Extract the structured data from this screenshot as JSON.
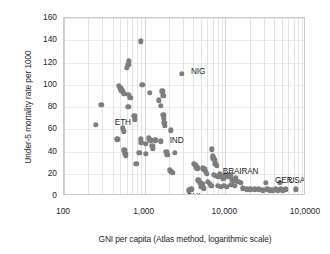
{
  "chart_data": {
    "type": "scatter",
    "title": "",
    "xlabel": "GNI per capita (Atlas method, logarithmic scale)",
    "ylabel": "Under-5 mortality rate per 1000",
    "xscale": "log",
    "xlim": [
      100,
      100000
    ],
    "ylim": [
      0,
      160
    ],
    "ytick_step": 20,
    "grid": true,
    "legend": "none",
    "marker_color": "#7d7d7d",
    "xticks": [
      {
        "value": 100,
        "label": "100"
      },
      {
        "value": 1000,
        "label": "1,000"
      },
      {
        "value": 10000,
        "label": "10,000"
      },
      {
        "value": 100000,
        "label": "10,0000"
      }
    ],
    "yticks": [
      {
        "value": 0,
        "label": "0"
      },
      {
        "value": 20,
        "label": "20"
      },
      {
        "value": 40,
        "label": "40"
      },
      {
        "value": 60,
        "label": "60"
      },
      {
        "value": 80,
        "label": "80"
      },
      {
        "value": 100,
        "label": "100"
      },
      {
        "value": 120,
        "label": "120"
      },
      {
        "value": 140,
        "label": "140"
      },
      {
        "value": 160,
        "label": "160"
      }
    ],
    "annotations": [
      {
        "text": "NIG",
        "x": 2900,
        "y": 110,
        "dx": 9,
        "dy": -2
      },
      {
        "text": "ETH",
        "x": 330,
        "y": 66,
        "dx": 9,
        "dy": 0
      },
      {
        "text": "IND",
        "x": 1580,
        "y": 49,
        "dx": 9,
        "dy": 0
      },
      {
        "text": "BRA",
        "x": 7200,
        "y": 19,
        "dx": 9,
        "dy": -3
      },
      {
        "text": "IRAN",
        "x": 11500,
        "y": 19,
        "dx": 9,
        "dy": -3
      },
      {
        "text": "GER",
        "x": 32000,
        "y": 12,
        "dx": 9,
        "dy": -2
      },
      {
        "text": "USA",
        "x": 47000,
        "y": 12,
        "dx": 9,
        "dy": -2
      },
      {
        "text": "CHI",
        "x": 3500,
        "y": 5,
        "dx": -2,
        "dy": 7
      }
    ],
    "points": [
      {
        "x": 900,
        "y": 139
      },
      {
        "x": 640,
        "y": 121
      },
      {
        "x": 630,
        "y": 118
      },
      {
        "x": 600,
        "y": 115
      },
      {
        "x": 2900,
        "y": 110
      },
      {
        "x": 480,
        "y": 99
      },
      {
        "x": 500,
        "y": 97
      },
      {
        "x": 515,
        "y": 95
      },
      {
        "x": 540,
        "y": 94
      },
      {
        "x": 560,
        "y": 92
      },
      {
        "x": 930,
        "y": 100
      },
      {
        "x": 1150,
        "y": 93
      },
      {
        "x": 1650,
        "y": 94
      },
      {
        "x": 1700,
        "y": 90
      },
      {
        "x": 640,
        "y": 91
      },
      {
        "x": 660,
        "y": 88
      },
      {
        "x": 1500,
        "y": 86
      },
      {
        "x": 290,
        "y": 82
      },
      {
        "x": 625,
        "y": 80
      },
      {
        "x": 1580,
        "y": 81
      },
      {
        "x": 745,
        "y": 72
      },
      {
        "x": 755,
        "y": 69
      },
      {
        "x": 1700,
        "y": 73
      },
      {
        "x": 1720,
        "y": 70
      },
      {
        "x": 1750,
        "y": 66
      },
      {
        "x": 250,
        "y": 64
      },
      {
        "x": 1780,
        "y": 63
      },
      {
        "x": 540,
        "y": 61
      },
      {
        "x": 550,
        "y": 58
      },
      {
        "x": 2120,
        "y": 59
      },
      {
        "x": 460,
        "y": 51
      },
      {
        "x": 890,
        "y": 51
      },
      {
        "x": 905,
        "y": 48
      },
      {
        "x": 1130,
        "y": 52
      },
      {
        "x": 1180,
        "y": 50
      },
      {
        "x": 1360,
        "y": 50
      },
      {
        "x": 1580,
        "y": 49
      },
      {
        "x": 1040,
        "y": 47
      },
      {
        "x": 1250,
        "y": 45
      },
      {
        "x": 1270,
        "y": 43
      },
      {
        "x": 560,
        "y": 41
      },
      {
        "x": 575,
        "y": 38
      },
      {
        "x": 585,
        "y": 36
      },
      {
        "x": 860,
        "y": 39
      },
      {
        "x": 1040,
        "y": 38
      },
      {
        "x": 1860,
        "y": 40
      },
      {
        "x": 2380,
        "y": 39
      },
      {
        "x": 1900,
        "y": 37
      },
      {
        "x": 6800,
        "y": 42
      },
      {
        "x": 7000,
        "y": 36
      },
      {
        "x": 7100,
        "y": 34
      },
      {
        "x": 7400,
        "y": 32
      },
      {
        "x": 790,
        "y": 29
      },
      {
        "x": 4050,
        "y": 29
      },
      {
        "x": 4250,
        "y": 28
      },
      {
        "x": 4350,
        "y": 26
      },
      {
        "x": 4500,
        "y": 25
      },
      {
        "x": 7500,
        "y": 29
      },
      {
        "x": 7800,
        "y": 27
      },
      {
        "x": 2050,
        "y": 23
      },
      {
        "x": 2150,
        "y": 22
      },
      {
        "x": 2250,
        "y": 21
      },
      {
        "x": 5300,
        "y": 25
      },
      {
        "x": 5500,
        "y": 24
      },
      {
        "x": 5700,
        "y": 22
      },
      {
        "x": 5900,
        "y": 20
      },
      {
        "x": 7200,
        "y": 19
      },
      {
        "x": 7600,
        "y": 18
      },
      {
        "x": 8200,
        "y": 17
      },
      {
        "x": 8600,
        "y": 20
      },
      {
        "x": 9000,
        "y": 18
      },
      {
        "x": 9400,
        "y": 16
      },
      {
        "x": 10200,
        "y": 19
      },
      {
        "x": 10800,
        "y": 17
      },
      {
        "x": 11500,
        "y": 19
      },
      {
        "x": 12000,
        "y": 15
      },
      {
        "x": 12800,
        "y": 14
      },
      {
        "x": 13500,
        "y": 16
      },
      {
        "x": 14500,
        "y": 13
      },
      {
        "x": 15500,
        "y": 12
      },
      {
        "x": 4600,
        "y": 14
      },
      {
        "x": 4900,
        "y": 12
      },
      {
        "x": 5200,
        "y": 11
      },
      {
        "x": 6100,
        "y": 13
      },
      {
        "x": 6400,
        "y": 11
      },
      {
        "x": 6700,
        "y": 9
      },
      {
        "x": 5000,
        "y": 8
      },
      {
        "x": 5400,
        "y": 7
      },
      {
        "x": 3500,
        "y": 5
      },
      {
        "x": 3800,
        "y": 6
      },
      {
        "x": 8000,
        "y": 9
      },
      {
        "x": 8800,
        "y": 8
      },
      {
        "x": 9600,
        "y": 9
      },
      {
        "x": 10500,
        "y": 8
      },
      {
        "x": 11800,
        "y": 10
      },
      {
        "x": 13000,
        "y": 9
      },
      {
        "x": 16500,
        "y": 7
      },
      {
        "x": 18500,
        "y": 6
      },
      {
        "x": 20500,
        "y": 6
      },
      {
        "x": 23000,
        "y": 6
      },
      {
        "x": 26000,
        "y": 6
      },
      {
        "x": 29000,
        "y": 5
      },
      {
        "x": 32000,
        "y": 12
      },
      {
        "x": 33000,
        "y": 6
      },
      {
        "x": 36000,
        "y": 5
      },
      {
        "x": 39000,
        "y": 5
      },
      {
        "x": 42000,
        "y": 6
      },
      {
        "x": 45000,
        "y": 5
      },
      {
        "x": 47000,
        "y": 12
      },
      {
        "x": 49000,
        "y": 6
      },
      {
        "x": 52000,
        "y": 5
      },
      {
        "x": 56000,
        "y": 6
      },
      {
        "x": 75000,
        "y": 6
      }
    ]
  }
}
